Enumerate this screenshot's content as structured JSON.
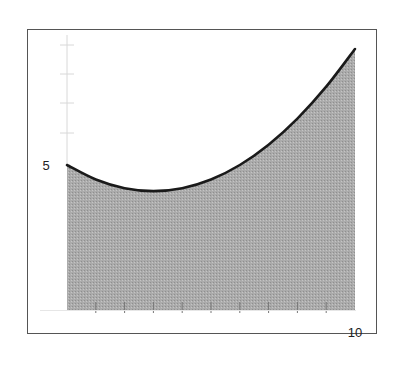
{
  "chart_data": {
    "type": "area",
    "title": "",
    "xlabel": "",
    "ylabel": "",
    "x": [
      0,
      1,
      2,
      3,
      4,
      5,
      6,
      7,
      8,
      9,
      10
    ],
    "series": [
      {
        "name": "f(x)",
        "values": [
          5.0,
          4.5,
          4.2,
          4.1,
          4.2,
          4.5,
          5.0,
          5.7,
          6.6,
          7.7,
          9.0
        ]
      }
    ],
    "xlim": [
      0,
      10
    ],
    "ylim": [
      0,
      9
    ],
    "x_tick_labels": [
      "10"
    ],
    "y_tick_labels": [
      "5"
    ],
    "x_ticks": [
      1,
      2,
      3,
      4,
      5,
      6,
      7,
      8,
      9
    ],
    "grid": false,
    "legend": "none",
    "colors": {
      "fill": "#a6a6a6",
      "line": "#1a1a1a",
      "frame": "#555555"
    }
  },
  "labels": {
    "y_label_5": "5",
    "x_label_10": "10"
  }
}
